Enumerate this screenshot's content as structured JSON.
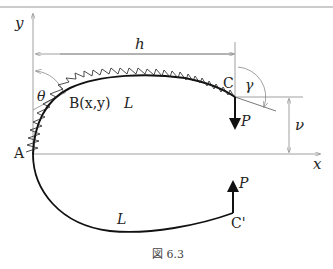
{
  "figure": {
    "caption": "図 6.3",
    "axes": {
      "x_label": "x",
      "y_label": "y"
    },
    "points": {
      "A": "A",
      "B": "B(x,y)",
      "C": "C",
      "C_prime": "C'"
    },
    "dimensions": {
      "horizontal": "h",
      "vertical": "ν"
    },
    "angles": {
      "theta": "θ",
      "gamma": "γ"
    },
    "length_labels": {
      "upper": "L",
      "lower": "L"
    },
    "forces": {
      "upper": "P",
      "lower": "P"
    },
    "colors": {
      "line": "#111111",
      "thin": "#888888",
      "text": "#222222"
    }
  }
}
